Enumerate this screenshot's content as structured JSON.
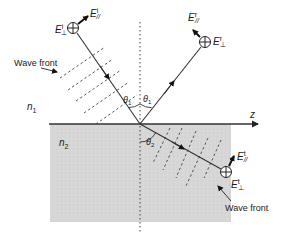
{
  "diagram": {
    "colors": {
      "background": "#ffffff",
      "medium2_fill": "#d8d8d8",
      "line": "#222222",
      "dashed": "#555555"
    },
    "axis": {
      "label": "z"
    },
    "media": {
      "upper": {
        "label": "n",
        "subscript": "1"
      },
      "lower": {
        "label": "n",
        "subscript": "2"
      }
    },
    "angles": {
      "incident": {
        "label": "θ",
        "subscript": "1"
      },
      "reflected": {
        "label": "θ",
        "subscript": "1"
      },
      "transmitted": {
        "label": "θ",
        "subscript": "2"
      }
    },
    "fields": {
      "incident": {
        "perp": {
          "base": "E",
          "sup": "i",
          "sub": "⊥"
        },
        "par": {
          "base": "E",
          "sup": "i",
          "sub": "//"
        }
      },
      "reflected": {
        "perp": {
          "base": "E",
          "sup": "r",
          "sub": "⊥"
        },
        "par": {
          "base": "E",
          "sup": "r",
          "sub": "//"
        }
      },
      "transmitted": {
        "perp": {
          "base": "E",
          "sup": "t",
          "sub": "⊥"
        },
        "par": {
          "base": "E",
          "sup": "t",
          "sub": "//"
        }
      }
    },
    "annotations": {
      "wavefront_incident": "Wave front",
      "wavefront_transmitted": "Wave front"
    }
  }
}
